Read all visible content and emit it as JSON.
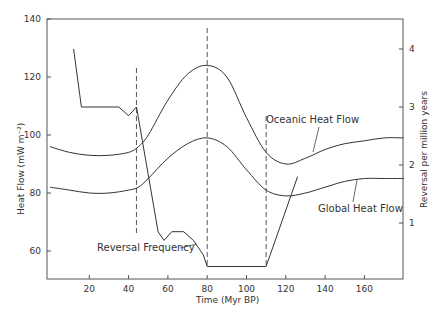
{
  "chart_data": {
    "type": "line",
    "title": "",
    "xlabel": "Time (Myr BP)",
    "ylabel": "Heat Flow (mW m⁻²)",
    "y2label": "Reversal per million years",
    "xlim": [
      0,
      180
    ],
    "ylim": [
      50,
      140
    ],
    "y2lim": [
      0,
      4.5
    ],
    "xticks": [
      20,
      40,
      60,
      80,
      100,
      120,
      140,
      160
    ],
    "yticks": [
      60,
      80,
      100,
      120,
      140
    ],
    "y2ticks": [
      1,
      2,
      3,
      4
    ],
    "grid": false,
    "series": [
      {
        "name": "Oceanic Heat Flow",
        "axis": "left",
        "x": [
          0,
          10,
          20,
          30,
          40,
          45,
          50,
          60,
          70,
          80,
          90,
          100,
          110,
          120,
          130,
          140,
          150,
          160,
          170,
          180
        ],
        "values": [
          96,
          94,
          93,
          93,
          94,
          96,
          100,
          112,
          121,
          124,
          120,
          106,
          94,
          90,
          92,
          95,
          97,
          98,
          99,
          99
        ]
      },
      {
        "name": "Global Heat Flow",
        "axis": "left",
        "x": [
          0,
          10,
          20,
          30,
          40,
          45,
          50,
          60,
          70,
          80,
          90,
          100,
          110,
          120,
          130,
          140,
          150,
          160,
          170,
          180
        ],
        "values": [
          82,
          81,
          80,
          80,
          81,
          82,
          85,
          92,
          97,
          99,
          96,
          88,
          81,
          79,
          80,
          82,
          84,
          85,
          85,
          85
        ]
      },
      {
        "name": "Reversal Frequency",
        "axis": "right",
        "x": [
          12,
          16,
          35,
          40,
          44,
          55,
          58,
          62,
          68,
          73,
          78,
          80,
          110,
          126
        ],
        "values": [
          4.0,
          3.0,
          3.0,
          2.85,
          3.0,
          0.85,
          0.7,
          0.85,
          0.85,
          0.7,
          0.45,
          0.25,
          0.25,
          1.8
        ]
      }
    ],
    "vertical_markers": [
      44,
      80,
      110
    ],
    "annotations": [
      "Oceanic Heat Flow",
      "Global Heat Flow",
      "Reversal Frequency"
    ]
  },
  "labels": {
    "oceanic": "Oceanic Heat Flow",
    "global": "Global Heat Flow",
    "reversal": "Reversal Frequency",
    "xaxis": "Time (Myr BP)",
    "yaxis": "Heat Flow (mW m⁻²)",
    "y2axis": "Reversal per million years"
  }
}
